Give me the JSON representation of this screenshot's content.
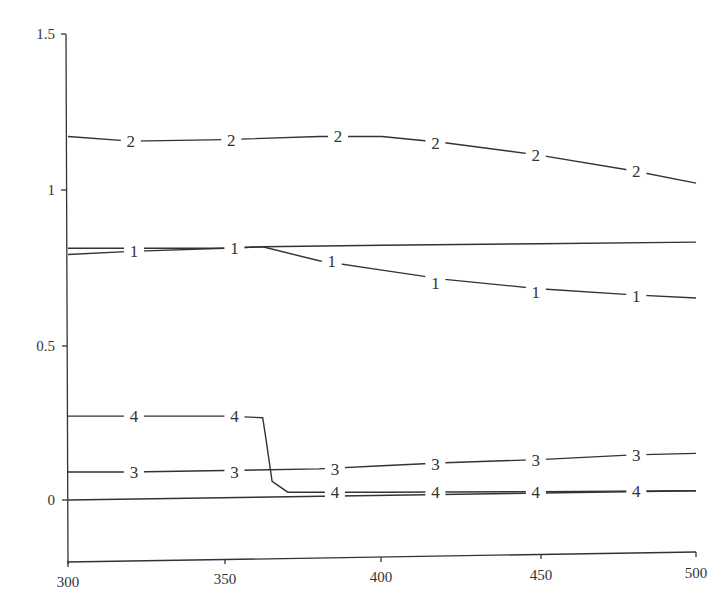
{
  "chart_data": {
    "type": "line",
    "title": "",
    "xlabel": "",
    "ylabel": "",
    "xlim": [
      300,
      500
    ],
    "ylim": [
      -0.2,
      1.5
    ],
    "grid": false,
    "legend": "none (curves labeled inline with numbers 1-4)",
    "x_ticks": [
      "300",
      "350",
      "400",
      "450",
      "500"
    ],
    "y_ticks": [
      "0",
      "0.5",
      "1",
      "1.5"
    ],
    "series": [
      {
        "name": "2",
        "x": [
          300,
          320,
          350,
          380,
          400,
          420,
          450,
          480,
          500
        ],
        "values": [
          1.17,
          1.155,
          1.16,
          1.17,
          1.17,
          1.15,
          1.11,
          1.06,
          1.02
        ]
      },
      {
        "name": "1 (upper branch)",
        "x": [
          300,
          320,
          350,
          362,
          400,
          450,
          500
        ],
        "values": [
          0.81,
          0.81,
          0.81,
          0.815,
          0.82,
          0.825,
          0.83
        ]
      },
      {
        "name": "1",
        "x": [
          300,
          320,
          350,
          362,
          380,
          400,
          420,
          450,
          480,
          500
        ],
        "values": [
          0.79,
          0.8,
          0.81,
          0.815,
          0.77,
          0.74,
          0.71,
          0.68,
          0.66,
          0.65
        ]
      },
      {
        "name": "4",
        "x": [
          300,
          320,
          350,
          362,
          363,
          365,
          370,
          380,
          400,
          450,
          500
        ],
        "values": [
          0.27,
          0.27,
          0.27,
          0.265,
          0.2,
          0.06,
          0.025,
          0.025,
          0.025,
          0.027,
          0.03
        ]
      },
      {
        "name": "3",
        "x": [
          300,
          320,
          350,
          380,
          400,
          420,
          450,
          480,
          500
        ],
        "values": [
          0.09,
          0.09,
          0.095,
          0.1,
          0.11,
          0.12,
          0.13,
          0.145,
          0.15
        ]
      },
      {
        "name": "0 (baseline)",
        "x": [
          300,
          500
        ],
        "values": [
          0.0,
          0.03
        ]
      }
    ],
    "inline_labels": [
      {
        "text": "2",
        "x": 320,
        "y": 1.155
      },
      {
        "text": "2",
        "x": 352,
        "y": 1.16
      },
      {
        "text": "2",
        "x": 386,
        "y": 1.17
      },
      {
        "text": "2",
        "x": 417,
        "y": 1.15
      },
      {
        "text": "2",
        "x": 449,
        "y": 1.11
      },
      {
        "text": "2",
        "x": 481,
        "y": 1.06
      },
      {
        "text": "1",
        "x": 321,
        "y": 0.8
      },
      {
        "text": "1",
        "x": 353,
        "y": 0.81
      },
      {
        "text": "1",
        "x": 384,
        "y": 0.77
      },
      {
        "text": "1",
        "x": 417,
        "y": 0.7
      },
      {
        "text": "1",
        "x": 449,
        "y": 0.67
      },
      {
        "text": "1",
        "x": 481,
        "y": 0.655
      },
      {
        "text": "4",
        "x": 321,
        "y": 0.27
      },
      {
        "text": "4",
        "x": 353,
        "y": 0.27
      },
      {
        "text": "4",
        "x": 385,
        "y": 0.025
      },
      {
        "text": "4",
        "x": 417,
        "y": 0.025
      },
      {
        "text": "4",
        "x": 449,
        "y": 0.025
      },
      {
        "text": "4",
        "x": 481,
        "y": 0.03
      },
      {
        "text": "3",
        "x": 321,
        "y": 0.09
      },
      {
        "text": "3",
        "x": 353,
        "y": 0.09
      },
      {
        "text": "3",
        "x": 385,
        "y": 0.1
      },
      {
        "text": "3",
        "x": 417,
        "y": 0.115
      },
      {
        "text": "3",
        "x": 449,
        "y": 0.13
      },
      {
        "text": "3",
        "x": 481,
        "y": 0.145
      }
    ]
  },
  "axes": {
    "x_ticks": [
      "300",
      "350",
      "400",
      "450",
      "500"
    ],
    "y_ticks": [
      "0",
      "0.5",
      "1",
      "1.5"
    ]
  }
}
